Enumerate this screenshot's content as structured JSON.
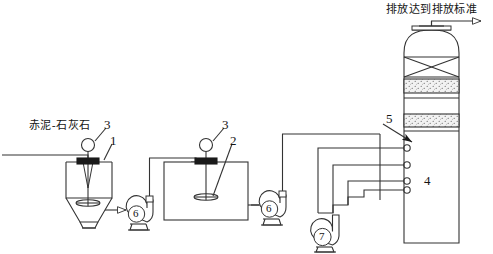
{
  "diagram": {
    "title_text": "排放达到排放标准",
    "labels": {
      "feed_text": "赤泥-石灰石",
      "tank1_number": "1",
      "tank2_number": "2",
      "agitator1_number": "3",
      "agitator2_number": "3",
      "nozzle_number": "4",
      "packing_number": "5",
      "pump1_number": "6",
      "pump2_number": "6",
      "pump3_number": "7"
    },
    "colors": {
      "line": "#333333",
      "background": "#ffffff",
      "packing_fill": "#e8e8e8",
      "agitator_cap": "#1a1a1a",
      "text": "#141414"
    },
    "components": {
      "tank1_name": "赤泥-石灰石浆液配制槽",
      "tank2_name": "浆液储槽",
      "tower_name": "吸收塔",
      "mist_eliminator_name": "除雾器",
      "packing_beds": 2,
      "nozzle_count": 4,
      "pump_count": 3
    }
  }
}
